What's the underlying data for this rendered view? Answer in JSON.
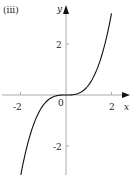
{
  "panel_label": "(iii)",
  "chart_data": {
    "type": "line",
    "title": "(iii)",
    "xlabel": "x",
    "ylabel": "y",
    "x_ticks": [
      -2,
      2
    ],
    "y_ticks": [
      2,
      -2
    ],
    "origin_label": "0",
    "xlim": [
      -2.9,
      2.9
    ],
    "ylim": [
      -3.15,
      3.7
    ],
    "grid": false,
    "legend": null,
    "series": [
      {
        "name": "curve",
        "description": "cubic-like increasing curve through origin with inflection at origin",
        "x": [
          -2.0,
          -1.5,
          -1.0,
          -0.5,
          0.0,
          0.5,
          1.0,
          1.5,
          2.0
        ],
        "y": [
          -3.2,
          -1.35,
          -0.4,
          -0.05,
          0.0,
          0.05,
          0.4,
          1.35,
          3.2
        ]
      }
    ],
    "colors": {
      "axis": "#aaaaaa",
      "curve": "#111111",
      "text": "#222222"
    }
  }
}
